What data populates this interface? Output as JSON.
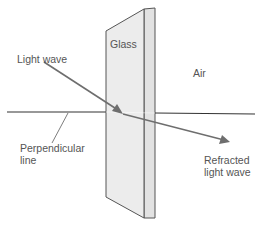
{
  "diagram": {
    "labels": {
      "light_wave": "Light wave",
      "glass": "Glass",
      "air": "Air",
      "perpendicular_line_1": "Perpendicular",
      "perpendicular_line_2": "line",
      "refracted_1": "Refracted",
      "refracted_2": "light wave"
    },
    "colors": {
      "glass_fill": "#ececec",
      "glass_side_fill": "#e2e2e2",
      "outline": "#555555",
      "perpendicular": "#333333",
      "ray": "#6e6e6e",
      "text": "#555555"
    }
  }
}
